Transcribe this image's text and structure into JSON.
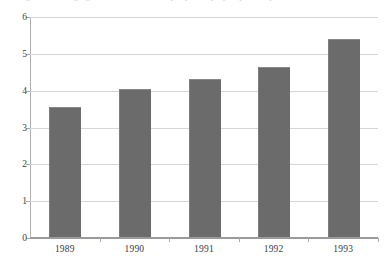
{
  "figure": {
    "top_caption_fragment": "Figure 1  Average growth rate of real output per employed person, percent"
  },
  "chart_data": {
    "type": "bar",
    "title": "",
    "subtitle": "",
    "xlabel": "",
    "ylabel": "",
    "categories": [
      "1989",
      "1990",
      "1991",
      "1992",
      "1993"
    ],
    "values": [
      3.5,
      4.0,
      4.25,
      4.6,
      5.35
    ],
    "series": [
      {
        "name": "",
        "values": [
          3.5,
          4.0,
          4.25,
          4.6,
          5.35
        ]
      }
    ],
    "ylim": [
      0,
      6
    ],
    "ytick_step": 1,
    "ytick_labels": [
      "0",
      "1",
      "2",
      "3",
      "4",
      "5",
      "6"
    ],
    "ytick_values": [
      0,
      1,
      2,
      3,
      4,
      5,
      6
    ],
    "grid": "horizontal",
    "legend": "none",
    "bar_color": "#6b6b6b",
    "gridline_color": "#d6d6d6",
    "axis_color": "#9a9a9a",
    "background_color": "#ffffff"
  }
}
